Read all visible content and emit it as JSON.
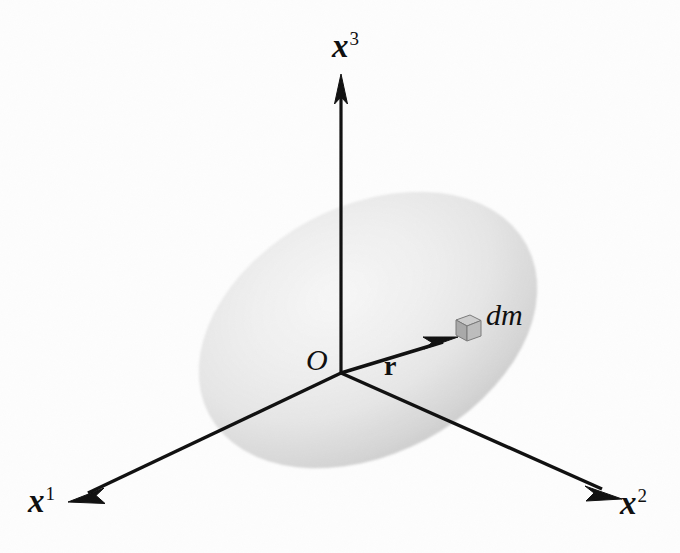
{
  "figure": {
    "type": "physics-diagram",
    "background_color": "#fdfdfd",
    "ink_color": "#101010"
  },
  "axes": {
    "x1": {
      "label_base": "x",
      "label_sup": "1",
      "origin": [
        341,
        373
      ],
      "tip": [
        72,
        500
      ],
      "direction": "down-left"
    },
    "x2": {
      "label_base": "x",
      "label_sup": "2",
      "origin": [
        341,
        373
      ],
      "tip": [
        618,
        497
      ],
      "direction": "down-right"
    },
    "x3": {
      "label_base": "x",
      "label_sup": "3",
      "origin": [
        341,
        373
      ],
      "tip": [
        341,
        78
      ],
      "direction": "up"
    }
  },
  "origin": {
    "label": "O",
    "position": [
      341,
      373
    ]
  },
  "vector": {
    "label": "r",
    "style": "bold-upright",
    "tail": [
      341,
      373
    ],
    "tip": [
      456,
      338
    ],
    "label_position": [
      392,
      368
    ]
  },
  "mass_element": {
    "label": "dm",
    "shape": "cube",
    "position": [
      463,
      328
    ],
    "top_face_color": "#c9c9c9",
    "front_face_color": "#a8a8a8",
    "side_face_color": "#8f8f8f",
    "edge_color": "#6e6e6e"
  },
  "body": {
    "shape": "ellipse",
    "description": "shaded rigid body (ellipsoid)",
    "center": [
      368,
      330
    ],
    "radius_x": 180,
    "radius_y": 124,
    "rotation_deg": -28,
    "fill_light": "#f2f2f2",
    "fill_mid": "#e3e3e3",
    "fill_dark": "#c4c4c4",
    "highlight_center": "#f6f6f6"
  }
}
